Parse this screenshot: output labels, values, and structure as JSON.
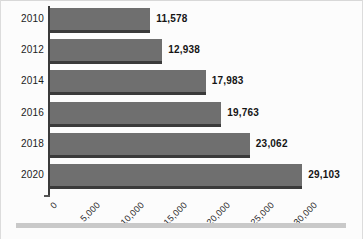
{
  "chart_data": {
    "type": "bar",
    "orientation": "horizontal",
    "title": "",
    "subtitle": "",
    "xlabel": "",
    "ylabel": "",
    "categories": [
      "2010",
      "2012",
      "2014",
      "2016",
      "2018",
      "2020"
    ],
    "values": [
      11578,
      12938,
      17983,
      19763,
      23062,
      29103
    ],
    "value_labels": [
      "11,578",
      "12,938",
      "17,983",
      "19,763",
      "23,062",
      "29,103"
    ],
    "xlim": [
      0,
      30000
    ],
    "xticks": [
      0,
      5000,
      10000,
      15000,
      20000,
      25000,
      30000
    ],
    "xtick_labels": [
      "0",
      "5,000",
      "10,000",
      "15,000",
      "20,000",
      "25,000",
      "30,000"
    ],
    "grid": false,
    "legend": null,
    "series": [
      {
        "name": "",
        "values": [
          11578,
          12938,
          17983,
          19763,
          23062,
          29103
        ]
      }
    ],
    "colors": {
      "bar_fill": "#6f6f6f",
      "bar_shadow": "#3a3a3a",
      "axis": "#3b3b3b",
      "background": "#fcfcfc",
      "text": "#151515",
      "divider": "#c9c9c9"
    }
  }
}
